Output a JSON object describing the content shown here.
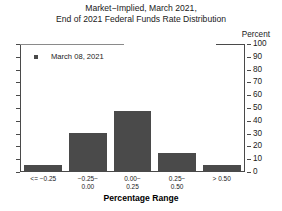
{
  "chart_data": {
    "type": "bar",
    "title": "Market−Implied, March 2021,\nEnd of 2021 Federal Funds Rate Distribution",
    "title_line1": "Market−Implied, March 2021,",
    "title_line2": "End of 2021 Federal Funds Rate Distribution",
    "xlabel": "Percentage Range",
    "ylabel": "Percent",
    "unit_label": "Percent",
    "categories": [
      "<= −0.25",
      "−0.25− 0.00",
      "0.00− 0.25",
      "0.25− 0.50",
      "> 0.50"
    ],
    "category_lines": [
      {
        "line1": "<= −0.25",
        "line2": ""
      },
      {
        "line1": "−0.25−",
        "line2": "0.00"
      },
      {
        "line1": "0.00−",
        "line2": "0.25"
      },
      {
        "line1": "0.25−",
        "line2": "0.50"
      },
      {
        "line1": "> 0.50",
        "line2": ""
      }
    ],
    "values": [
      5,
      30,
      48,
      14,
      5
    ],
    "series": [
      {
        "name": "March 08, 2021",
        "values": [
          5,
          30,
          48,
          14,
          5
        ]
      }
    ],
    "ylim": [
      0,
      100
    ],
    "yticks": [
      100,
      90,
      80,
      70,
      60,
      50,
      40,
      30,
      20,
      10,
      0
    ],
    "ytick_labels": [
      "100",
      "90",
      "80",
      "70",
      "60",
      "50",
      "40",
      "30",
      "20",
      "10",
      "0"
    ],
    "grid": false,
    "legend_position": "top-left",
    "bar_color": "#4a4a4a",
    "axis_color": "#4a4a4a"
  },
  "legend": {
    "entries": [
      {
        "label": "March 08, 2021",
        "color": "#4a4a4a",
        "marker": "square"
      }
    ]
  }
}
